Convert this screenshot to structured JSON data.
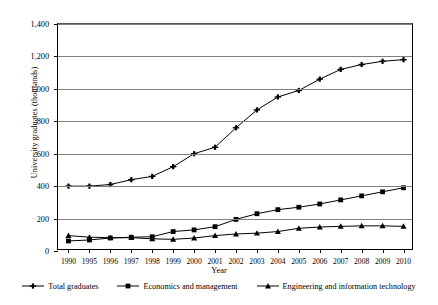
{
  "chart_data": {
    "type": "line",
    "title": "",
    "xlabel": "Year",
    "ylabel": "University graduates (thousands)",
    "categories": [
      "1990",
      "1995",
      "1996",
      "1997",
      "1998",
      "1999",
      "2000",
      "2001",
      "2002",
      "2003",
      "2004",
      "2005",
      "2006",
      "2007",
      "2008",
      "2009",
      "2010"
    ],
    "ylim": [
      0,
      1400
    ],
    "yticks": [
      0,
      200,
      400,
      600,
      800,
      1000,
      1200,
      1400
    ],
    "ytick_labels": [
      "0",
      "200",
      "400",
      "600",
      "800",
      "1,000",
      "1,200",
      "1,400"
    ],
    "grid": true,
    "legend_position": "bottom",
    "series": [
      {
        "name": "Total graduates",
        "marker": "plus",
        "color": "#000000",
        "values": [
          400,
          400,
          410,
          440,
          460,
          520,
          600,
          640,
          760,
          870,
          950,
          990,
          1060,
          1120,
          1150,
          1170,
          1180
        ]
      },
      {
        "name": "Economics and management",
        "marker": "square",
        "color": "#000000",
        "values": [
          62,
          68,
          80,
          85,
          88,
          120,
          130,
          150,
          195,
          230,
          255,
          270,
          290,
          315,
          340,
          365,
          390
        ]
      },
      {
        "name": "Engineering and information technology",
        "marker": "triangle",
        "color": "#000000",
        "values": [
          95,
          85,
          82,
          82,
          75,
          72,
          80,
          95,
          105,
          110,
          120,
          140,
          148,
          152,
          155,
          155,
          152
        ]
      }
    ]
  },
  "axis": {
    "y_title": "University graduates (thousands)",
    "x_title": "Year"
  }
}
